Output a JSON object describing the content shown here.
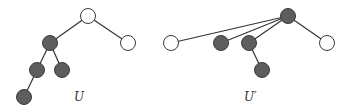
{
  "colors": {
    "filled_node": "#5e5e5e",
    "empty_node": "#ffffff",
    "stroke": "#3a3a3a",
    "edge": "#333333"
  },
  "trees": [
    {
      "label": "U",
      "label_pos": [
        74,
        101
      ],
      "nodes": [
        {
          "id": "a",
          "x": 88,
          "y": 16,
          "filled": false
        },
        {
          "id": "b",
          "x": 50,
          "y": 43,
          "filled": true
        },
        {
          "id": "c",
          "x": 128,
          "y": 43,
          "filled": false
        },
        {
          "id": "d",
          "x": 37,
          "y": 70,
          "filled": true
        },
        {
          "id": "e",
          "x": 62,
          "y": 70,
          "filled": true
        },
        {
          "id": "f",
          "x": 24,
          "y": 97,
          "filled": true
        }
      ],
      "edges": [
        [
          "a",
          "b"
        ],
        [
          "a",
          "c"
        ],
        [
          "b",
          "d"
        ],
        [
          "b",
          "e"
        ],
        [
          "d",
          "f"
        ]
      ]
    },
    {
      "label": "U′",
      "label_pos": [
        244,
        101
      ],
      "nodes": [
        {
          "id": "a",
          "x": 288,
          "y": 16,
          "filled": true
        },
        {
          "id": "b",
          "x": 171,
          "y": 43,
          "filled": false
        },
        {
          "id": "c",
          "x": 221,
          "y": 43,
          "filled": true
        },
        {
          "id": "d",
          "x": 249,
          "y": 43,
          "filled": true
        },
        {
          "id": "e",
          "x": 327,
          "y": 43,
          "filled": false
        },
        {
          "id": "f",
          "x": 262,
          "y": 70,
          "filled": true
        }
      ],
      "edges": [
        [
          "a",
          "b"
        ],
        [
          "a",
          "c"
        ],
        [
          "a",
          "d"
        ],
        [
          "a",
          "e"
        ],
        [
          "d",
          "f"
        ]
      ]
    }
  ]
}
